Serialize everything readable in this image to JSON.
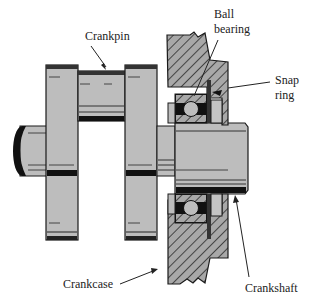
{
  "diagram": {
    "type": "mechanical cross-section",
    "colors": {
      "part_fill": "#bdbdbd",
      "outline": "#1a1a1a",
      "hatch": "#2a2a2a",
      "housing_fill": "#9e9e9e",
      "background": "#ffffff"
    },
    "labels": {
      "crankpin": "Crankpin",
      "ball_bearing_line1": "Ball",
      "ball_bearing_line2": "bearing",
      "snap_ring_line1": "Snap",
      "snap_ring_line2": "ring",
      "crankcase": "Crankcase",
      "crankshaft": "Crankshaft"
    }
  }
}
